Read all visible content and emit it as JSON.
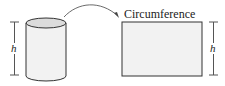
{
  "diagram": {
    "cylinder": {
      "height_label": "h"
    },
    "rectangle": {
      "top_label": "Circumference",
      "height_label": "h"
    },
    "colors": {
      "stroke": "#333333",
      "fill_body": "#f2f2f2",
      "fill_top": "#dcdcdc",
      "bar": "#555555"
    }
  }
}
